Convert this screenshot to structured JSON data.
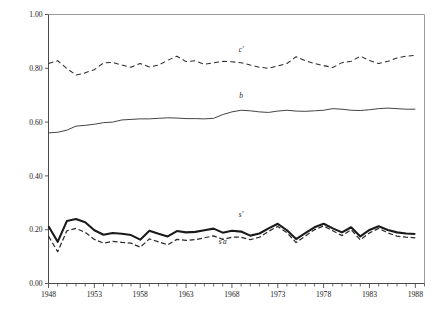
{
  "chart_data": {
    "type": "line",
    "title": "",
    "subtitle": "",
    "xlabel": "",
    "ylabel": "",
    "xlim": [
      1948,
      1989
    ],
    "ylim": [
      0.0,
      1.0
    ],
    "grid": false,
    "legend_position": "inline-annotations",
    "x_tick_labels": [
      "1948",
      "1953",
      "1958",
      "1963",
      "1968",
      "1973",
      "1978",
      "1983",
      "1988"
    ],
    "x_tick_values": [
      1948,
      1953,
      1958,
      1963,
      1968,
      1973,
      1978,
      1983,
      1988
    ],
    "x_minor_tick_interval": 1,
    "y_tick_labels": [
      "0.00",
      "0.20",
      "0.40",
      "0.60",
      "0.80",
      "1.00"
    ],
    "y_tick_values": [
      0.0,
      0.2,
      0.4,
      0.6,
      0.8,
      1.0
    ],
    "x": [
      1948,
      1949,
      1950,
      1951,
      1952,
      1953,
      1954,
      1955,
      1956,
      1957,
      1958,
      1959,
      1960,
      1961,
      1962,
      1963,
      1964,
      1965,
      1966,
      1967,
      1968,
      1969,
      1970,
      1971,
      1972,
      1973,
      1974,
      1975,
      1976,
      1977,
      1978,
      1979,
      1980,
      1981,
      1982,
      1983,
      1984,
      1985,
      1986,
      1987,
      1988
    ],
    "series": [
      {
        "name": "c'",
        "label": "c'",
        "style": "dashed",
        "label_x": 1969,
        "label_y": 0.862,
        "values": [
          0.818,
          0.828,
          0.799,
          0.775,
          0.783,
          0.795,
          0.82,
          0.822,
          0.812,
          0.804,
          0.818,
          0.805,
          0.812,
          0.83,
          0.845,
          0.825,
          0.828,
          0.815,
          0.82,
          0.826,
          0.824,
          0.821,
          0.812,
          0.804,
          0.8,
          0.809,
          0.818,
          0.843,
          0.828,
          0.818,
          0.81,
          0.803,
          0.821,
          0.826,
          0.845,
          0.829,
          0.818,
          0.826,
          0.838,
          0.845,
          0.848
        ]
      },
      {
        "name": "b",
        "label": "b",
        "style": "solid-thin",
        "label_x": 1969,
        "label_y": 0.69,
        "values": [
          0.56,
          0.562,
          0.57,
          0.585,
          0.588,
          0.592,
          0.598,
          0.6,
          0.608,
          0.61,
          0.612,
          0.612,
          0.614,
          0.616,
          0.615,
          0.613,
          0.613,
          0.612,
          0.614,
          0.628,
          0.638,
          0.644,
          0.642,
          0.638,
          0.636,
          0.641,
          0.644,
          0.641,
          0.64,
          0.642,
          0.644,
          0.65,
          0.648,
          0.644,
          0.643,
          0.646,
          0.65,
          0.652,
          0.65,
          0.648,
          0.648
        ]
      },
      {
        "name": "s'",
        "label": "s'",
        "style": "solid-thick",
        "label_x": 1969,
        "label_y": 0.248,
        "values": [
          0.213,
          0.155,
          0.232,
          0.24,
          0.228,
          0.198,
          0.181,
          0.188,
          0.185,
          0.18,
          0.163,
          0.196,
          0.185,
          0.175,
          0.195,
          0.19,
          0.192,
          0.198,
          0.204,
          0.189,
          0.196,
          0.193,
          0.178,
          0.186,
          0.205,
          0.222,
          0.198,
          0.165,
          0.187,
          0.209,
          0.222,
          0.205,
          0.19,
          0.209,
          0.175,
          0.199,
          0.213,
          0.199,
          0.19,
          0.186,
          0.184
        ]
      },
      {
        "name": "s'a",
        "label": "s'a",
        "style": "dashed",
        "label_x": 1967,
        "label_y": 0.148,
        "values": [
          0.176,
          0.118,
          0.196,
          0.205,
          0.19,
          0.164,
          0.15,
          0.157,
          0.153,
          0.15,
          0.135,
          0.166,
          0.155,
          0.144,
          0.164,
          0.16,
          0.163,
          0.17,
          0.177,
          0.164,
          0.172,
          0.172,
          0.163,
          0.172,
          0.194,
          0.212,
          0.189,
          0.152,
          0.176,
          0.2,
          0.214,
          0.196,
          0.178,
          0.2,
          0.162,
          0.188,
          0.205,
          0.188,
          0.176,
          0.172,
          0.17
        ]
      }
    ],
    "colors": {
      "series_c": "#2b2b2b",
      "series_b": "#3a3a3a",
      "series_s": "#1a1a1a",
      "series_sa": "#2b2b2b",
      "axis": "#4a4a4a",
      "frame": "#9a9a9a",
      "background": "#ffffff"
    }
  }
}
